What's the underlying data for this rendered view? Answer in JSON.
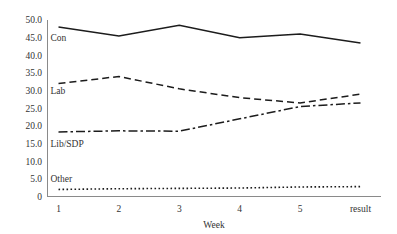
{
  "chart_data": {
    "type": "line",
    "title": "",
    "xlabel": "Week",
    "ylabel": "",
    "grid": false,
    "legend_position": "inline-left",
    "categories": [
      "1",
      "2",
      "3",
      "4",
      "5",
      "result"
    ],
    "x": [
      1,
      2,
      3,
      4,
      5,
      6
    ],
    "ylim": [
      0,
      50
    ],
    "xlim": [
      1,
      6
    ],
    "ytick_labels": [
      "0",
      "5.0",
      "10.0",
      "15.0",
      "20.0",
      "25.0",
      "30.0",
      "35.0",
      "40.0",
      "45.0",
      "50.0"
    ],
    "ytick_values": [
      0,
      5,
      10,
      15,
      20,
      25,
      30,
      35,
      40,
      45,
      50
    ],
    "xtick_labels": [
      "1",
      "2",
      "3",
      "4",
      "5",
      "result"
    ],
    "series": [
      {
        "name": "Con",
        "label": "Con",
        "style": "solid",
        "color": "#1c1c1c",
        "values": [
          48.0,
          45.5,
          48.5,
          45.0,
          46.0,
          43.5
        ]
      },
      {
        "name": "Lab",
        "label": "Lab",
        "style": "dashed",
        "color": "#1c1c1c",
        "values": [
          32.0,
          34.0,
          30.5,
          28.0,
          26.5,
          29.0
        ]
      },
      {
        "name": "Lib/SDP",
        "label": "Lib/SDP",
        "style": "dashdot",
        "color": "#1c1c1c",
        "values": [
          18.3,
          18.6,
          18.5,
          22.0,
          25.5,
          26.5
        ]
      },
      {
        "name": "Other",
        "label": "Other",
        "style": "dotted",
        "color": "#1c1c1c",
        "values": [
          2.0,
          2.2,
          2.3,
          2.4,
          2.7,
          2.8
        ]
      }
    ],
    "series_label_anchors": [
      {
        "name": "Con",
        "x": 1.0,
        "y": 45.0
      },
      {
        "name": "Lab",
        "x": 1.0,
        "y": 30.0
      },
      {
        "name": "Lib/SDP",
        "x": 1.0,
        "y": 15.0
      },
      {
        "name": "Other",
        "x": 1.0,
        "y": 5.0
      }
    ]
  }
}
